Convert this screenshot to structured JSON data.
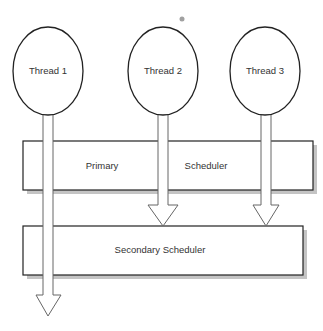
{
  "diagram": {
    "threads": [
      {
        "label": "Thread 1"
      },
      {
        "label": "Thread 2"
      },
      {
        "label": "Thread 3"
      }
    ],
    "primary_scheduler": {
      "label_left": "Primary",
      "label_right": "Scheduler"
    },
    "secondary_scheduler": {
      "label": "Secondary Scheduler"
    },
    "colors": {
      "stroke": "#222222",
      "arrow_stroke": "#666666",
      "shadow": "#bbbbbb",
      "dot": "#999999"
    }
  }
}
